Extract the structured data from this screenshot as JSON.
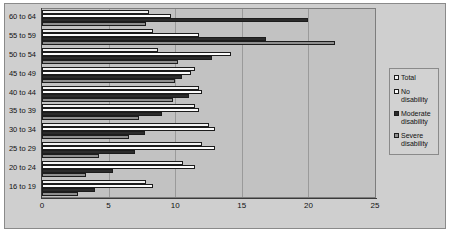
{
  "chart_data": {
    "type": "bar",
    "orientation": "horizontal",
    "title": "",
    "xlabel": "",
    "ylabel": "",
    "xlim": [
      0,
      25
    ],
    "xticks": [
      0,
      5,
      10,
      15,
      20,
      25
    ],
    "grid": true,
    "legend_position": "right",
    "categories": [
      "60 to 64",
      "55 to 59",
      "50 to 54",
      "45 to 49",
      "40 to 44",
      "35 to 39",
      "30 to 34",
      "25 to 29",
      "20 to 24",
      "16 to 19"
    ],
    "series": [
      {
        "name": "Total",
        "color": "#f2f2f2",
        "values": [
          8.0,
          8.3,
          8.7,
          11.5,
          11.8,
          11.5,
          12.5,
          12.0,
          10.6,
          7.8
        ]
      },
      {
        "name": "No disability",
        "color": "#fbfbfb",
        "values": [
          9.7,
          11.8,
          14.2,
          11.2,
          12.0,
          11.8,
          13.0,
          13.0,
          11.5,
          8.3
        ]
      },
      {
        "name": "Moderate disability",
        "color": "#2b2b2b",
        "values": [
          20.0,
          16.8,
          12.8,
          10.5,
          11.0,
          9.0,
          7.7,
          7.0,
          5.3,
          4.0
        ]
      },
      {
        "name": "Severe disability",
        "color": "#8f8f8f",
        "values": [
          7.8,
          22.0,
          10.2,
          10.0,
          9.8,
          7.3,
          6.5,
          4.3,
          3.3,
          2.7
        ]
      }
    ]
  },
  "legend": {
    "items": [
      {
        "label": "Total"
      },
      {
        "label": "No disability"
      },
      {
        "label": "Moderate disability"
      },
      {
        "label": "Severe disability"
      }
    ]
  },
  "colors": {
    "plot_background": "#c2c2c2",
    "panel_background": "#cfcfcf",
    "axis": "#3a3a3a",
    "gridline": "#9a9a9a"
  }
}
